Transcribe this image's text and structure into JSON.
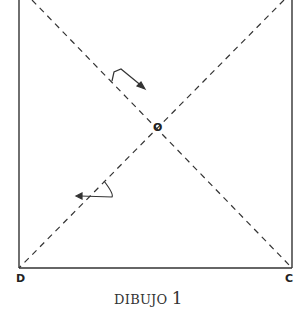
{
  "figure": {
    "caption_text": "DIBUJO",
    "caption_number": "1",
    "points": {
      "center": "O",
      "bottom_left": "D",
      "bottom_right": "C"
    },
    "colors": {
      "line": "#333333",
      "background": "#ffffff"
    }
  }
}
